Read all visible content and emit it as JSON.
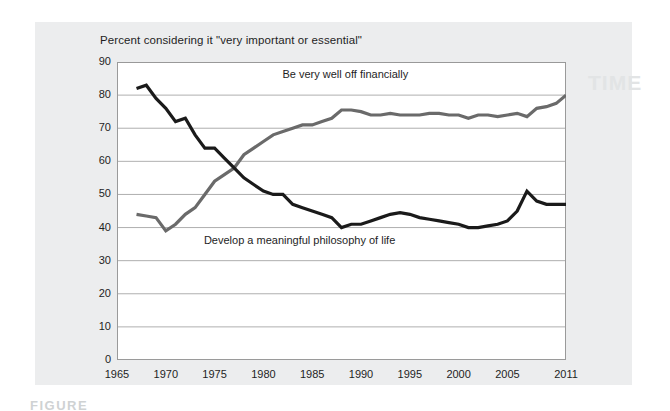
{
  "figure": {
    "title": "Percent considering it \"very important or essential\"",
    "caption": "FIGURE",
    "ghost_text": "TIME"
  },
  "axes": {
    "y_ticks": [
      "90",
      "80",
      "70",
      "60",
      "50",
      "40",
      "30",
      "20",
      "10",
      "0"
    ],
    "x_ticks": [
      "1965",
      "1970",
      "1975",
      "1980",
      "1985",
      "1990",
      "1995",
      "2000",
      "2005",
      "2011"
    ]
  },
  "annotations": {
    "financial": "Be very well off financially",
    "philosophy": "Develop a meaningful philosophy of life"
  },
  "colors": {
    "financial_line": "#6a6a6a",
    "philosophy_line": "#1a1a1a",
    "gridline": "#9a9a9a",
    "plot_background": "#ffffff",
    "card_background": "#ecedee",
    "page_background": "#ffffff"
  },
  "chart_data": {
    "type": "line",
    "title": "Percent considering it \"very important or essential\"",
    "xlabel": "",
    "ylabel": "Percent considering it \"very important or essential\"",
    "xlim": [
      1965,
      2011
    ],
    "ylim": [
      0,
      90
    ],
    "y_tick_step": 10,
    "x_tick_values": [
      1965,
      1970,
      1975,
      1980,
      1985,
      1990,
      1995,
      2000,
      2005,
      2011
    ],
    "grid": "horizontal",
    "legend": "inline-annotations",
    "series": [
      {
        "name": "Be very well off financially",
        "color": "#6a6a6a",
        "x": [
          1967,
          1968,
          1969,
          1970,
          1971,
          1972,
          1973,
          1974,
          1975,
          1976,
          1977,
          1978,
          1979,
          1980,
          1981,
          1982,
          1983,
          1984,
          1985,
          1986,
          1987,
          1988,
          1989,
          1990,
          1991,
          1992,
          1993,
          1994,
          1995,
          1996,
          1997,
          1998,
          1999,
          2000,
          2001,
          2002,
          2003,
          2004,
          2005,
          2006,
          2007,
          2008,
          2009,
          2010,
          2011
        ],
        "values": [
          44,
          43.5,
          43,
          39,
          41,
          44,
          46,
          50,
          54,
          56,
          58,
          62,
          64,
          66,
          68,
          69,
          70,
          71,
          71,
          72,
          73,
          75.5,
          75.5,
          75,
          74,
          74,
          74.5,
          74,
          74,
          74,
          74.5,
          74.5,
          74,
          74,
          73,
          74,
          74,
          73.5,
          74,
          74.5,
          73.5,
          76,
          76.5,
          77.5,
          80
        ]
      },
      {
        "name": "Develop a meaningful philosophy of life",
        "color": "#1a1a1a",
        "x": [
          1967,
          1968,
          1969,
          1970,
          1971,
          1972,
          1973,
          1974,
          1975,
          1976,
          1977,
          1978,
          1979,
          1980,
          1981,
          1982,
          1983,
          1984,
          1985,
          1986,
          1987,
          1988,
          1989,
          1990,
          1991,
          1992,
          1993,
          1994,
          1995,
          1996,
          1997,
          1998,
          1999,
          2000,
          2001,
          2002,
          2003,
          2004,
          2005,
          2006,
          2007,
          2008,
          2009,
          2010,
          2011
        ],
        "values": [
          82,
          83,
          79,
          76,
          72,
          73,
          68,
          64,
          64,
          61,
          58,
          55,
          53,
          51,
          50,
          50,
          47,
          46,
          45,
          44,
          43,
          40,
          41,
          41,
          42,
          43,
          44,
          44.5,
          44,
          43,
          42.5,
          42,
          41.5,
          41,
          40,
          40,
          40.5,
          41,
          42,
          45,
          51,
          48,
          47,
          47,
          47
        ]
      }
    ]
  }
}
